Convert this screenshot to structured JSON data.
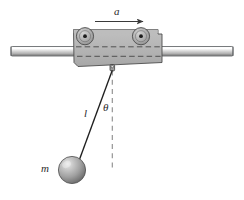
{
  "figure": {
    "type": "physics-free-body-diagram",
    "background_color": "#ffffff"
  },
  "labels": {
    "acceleration": "a",
    "length": "l",
    "angle": "θ",
    "mass": "m"
  },
  "elements": {
    "rail": {
      "name": "horizontal-rail",
      "color_top": "#f2f2f2",
      "color_mid": "#c9c9c9",
      "color_bottom": "#8f8f8f",
      "outline": "#4a4a4a"
    },
    "cart": {
      "name": "trolley-body",
      "fill": "#b4b4b4",
      "outline": "#4a4a4a",
      "hidden_edge_style": "dashed"
    },
    "wheels": {
      "count": 2,
      "fill": "#b0b0b0",
      "outline": "#4a4a4a",
      "axle_dot_color": "#1a1a1a"
    },
    "pivot": {
      "name": "pivot-eyelet",
      "fill": "#9a9a9a",
      "outline": "#3a3a3a"
    },
    "string": {
      "name": "pendulum-string",
      "color": "#1f1f1f"
    },
    "vertical_reference": {
      "name": "vertical-dashed-reference",
      "color": "#8d8d8d",
      "style": "dashed"
    },
    "bob": {
      "name": "pendulum-bob",
      "highlight": "#e0e0e0",
      "mid": "#a8a8a8",
      "shadow": "#5e5e5e",
      "outline": "#4a4a4a"
    },
    "arrow": {
      "name": "acceleration-arrow",
      "color": "#3a3a3a",
      "direction": "right"
    }
  }
}
